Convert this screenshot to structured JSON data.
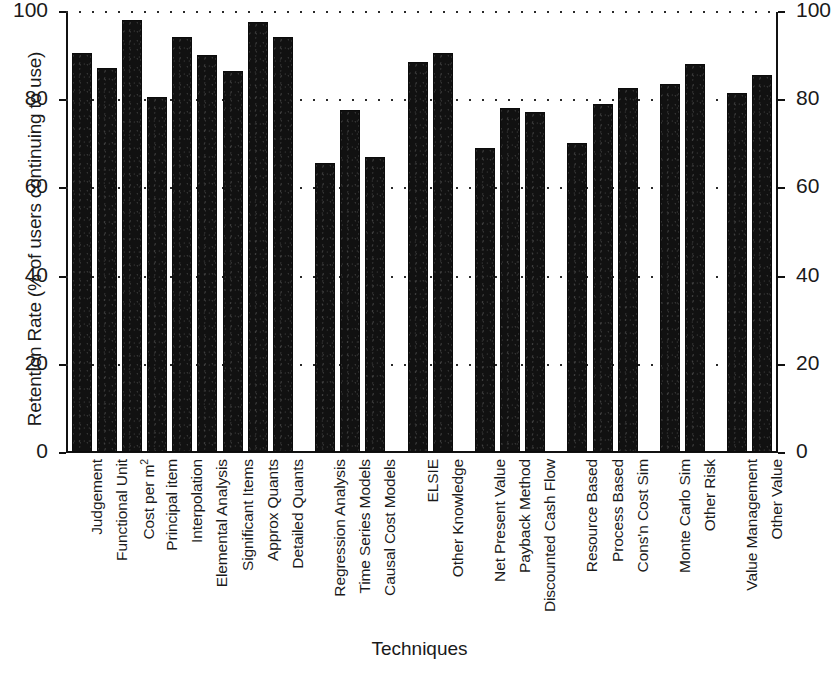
{
  "chart_data": {
    "type": "bar",
    "title": "",
    "xlabel": "Techniques",
    "ylabel": "Retention Rate (% of users continuing to use)",
    "ylabel_right": "Retention Rate (% of users continuing to use)",
    "ylim": [
      0,
      100
    ],
    "yticks": [
      0,
      20,
      40,
      60,
      80,
      100
    ],
    "ytick_labels": [
      "0",
      "20",
      "40",
      "60",
      "80",
      "100"
    ],
    "right_axis": true,
    "right_ytick_labels": [
      "0",
      "20",
      "40",
      "60",
      "80",
      "100"
    ],
    "grid": true,
    "grid_style": "dotted",
    "legend": "none",
    "bar_color": "#111111",
    "categories": [
      "Judgement",
      "Functional Unit",
      "Cost per m²",
      "Principal item",
      "Interpolation",
      "Elemental Analysis",
      "Significant Items",
      "Approx Quants",
      "Detailed Quants",
      "Regression Analysis",
      "Time Series Models",
      "Causal Cost Models",
      "ELSIE",
      "Other Knowledge",
      "Net Present Value",
      "Payback Method",
      "Discounted Cash Flow",
      "Resource Based",
      "Process Based",
      "Cons'n Cost Sim",
      "Monte Carlo Sim",
      "Other Risk",
      "Value Management",
      "Other Value"
    ],
    "values": [
      90.5,
      87.0,
      98.0,
      80.5,
      94.0,
      90.0,
      86.5,
      97.5,
      94.0,
      65.5,
      77.5,
      67.0,
      88.5,
      90.5,
      69.0,
      78.0,
      77.0,
      70.0,
      79.0,
      82.5,
      83.5,
      88.0,
      81.5,
      85.5
    ],
    "groups": [
      {
        "name": "Estimating Techniques",
        "start": 0,
        "count": 9
      },
      {
        "name": "Forecasting Models",
        "start": 9,
        "count": 3
      },
      {
        "name": "Knowledge Based",
        "start": 12,
        "count": 2
      },
      {
        "name": "Investment Appraisal",
        "start": 14,
        "count": 3
      },
      {
        "name": "Cost Simulation",
        "start": 17,
        "count": 3
      },
      {
        "name": "Risk Techniques",
        "start": 20,
        "count": 2
      },
      {
        "name": "Value Techniques",
        "start": 22,
        "count": 2
      }
    ]
  }
}
